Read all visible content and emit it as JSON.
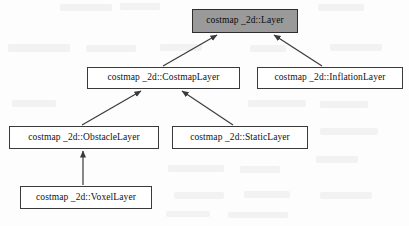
{
  "diagram": {
    "type": "uml-class-inheritance",
    "background_color": "#fdfdfd",
    "node_fill": "#ffffff",
    "root_fill": "#9a9a9a",
    "border_color": "#3a3a3a",
    "edge_color": "#3a3a3a",
    "nodes": [
      {
        "id": "layer",
        "label": "costmap _2d::Layer",
        "x": 192,
        "y": 9,
        "w": 106,
        "h": 24,
        "highlighted": true
      },
      {
        "id": "costmap_layer",
        "label": "costmap _2d::CostmapLayer",
        "x": 87,
        "y": 67,
        "w": 153,
        "h": 22,
        "highlighted": false
      },
      {
        "id": "inflation_layer",
        "label": "costmap _2d::InflationLayer",
        "x": 257,
        "y": 67,
        "w": 146,
        "h": 22,
        "highlighted": false
      },
      {
        "id": "obstacle_layer",
        "label": "costmap _2d::ObstacleLayer",
        "x": 9,
        "y": 126,
        "w": 150,
        "h": 23,
        "highlighted": false
      },
      {
        "id": "static_layer",
        "label": "costmap _2d::StaticLayer",
        "x": 172,
        "y": 126,
        "w": 136,
        "h": 23,
        "highlighted": false
      },
      {
        "id": "voxel_layer",
        "label": "costmap _2d::VoxelLayer",
        "x": 20,
        "y": 186,
        "w": 132,
        "h": 23,
        "highlighted": false
      }
    ],
    "edges": [
      {
        "id": "costmap-to-layer",
        "from": "costmap_layer",
        "to": "layer",
        "relation": "generalization",
        "arrowhead": "solid-triangle"
      },
      {
        "id": "inflation-to-layer",
        "from": "inflation_layer",
        "to": "layer",
        "relation": "generalization",
        "arrowhead": "solid-triangle"
      },
      {
        "id": "obstacle-to-costmap",
        "from": "obstacle_layer",
        "to": "costmap_layer",
        "relation": "generalization",
        "arrowhead": "solid-triangle"
      },
      {
        "id": "static-to-costmap",
        "from": "static_layer",
        "to": "costmap_layer",
        "relation": "generalization",
        "arrowhead": "solid-triangle"
      },
      {
        "id": "voxel-to-obstacle",
        "from": "voxel_layer",
        "to": "obstacle_layer",
        "relation": "generalization",
        "arrowhead": "solid-triangle"
      }
    ]
  }
}
